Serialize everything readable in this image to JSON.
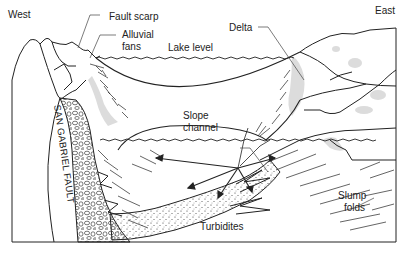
{
  "diagram": {
    "directions": {
      "left": "West",
      "right": "East"
    },
    "labels": {
      "fault_scarp": "Fault scarp",
      "alluvial_fans_1": "Alluvial",
      "alluvial_fans_2": "fans",
      "lake_level": "Lake level",
      "delta": "Delta",
      "slope_channel_1": "Slope",
      "slope_channel_2": "channel",
      "san_gabriel_fault": "SAN GABRIEL FAULT",
      "slump_folds_1": "Slump",
      "slump_folds_2": "folds",
      "turbidites": "Turbidites"
    },
    "colors": {
      "line": "#222222",
      "shade": "#d9d9d9",
      "background": "#ffffff"
    }
  }
}
